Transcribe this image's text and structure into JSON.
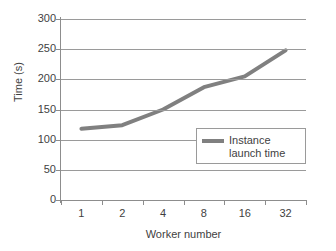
{
  "chart_data": {
    "type": "line",
    "title": "",
    "xlabel": "Worker number",
    "ylabel": "Time (s)",
    "categories": [
      "1",
      "2",
      "4",
      "8",
      "16",
      "32"
    ],
    "x_tick_labels": [
      "1",
      "2",
      "4",
      "8",
      "16",
      "32"
    ],
    "y_tick_labels": [
      "0",
      "50",
      "100",
      "150",
      "200",
      "250",
      "300"
    ],
    "y_ticks": [
      0,
      50,
      100,
      150,
      200,
      250,
      300
    ],
    "ylim": [
      0,
      300
    ],
    "grid": "horizontal",
    "legend_position": "inside-lower-right",
    "series": [
      {
        "name": "Instance launch time",
        "color": "#808080",
        "values": [
          118,
          124,
          150,
          187,
          205,
          248
        ]
      }
    ]
  },
  "legend": {
    "entries": [
      {
        "label_line1": "Instance",
        "label_line2": "launch time",
        "color": "#808080"
      }
    ]
  },
  "axes": {
    "y_title": "Time (s)",
    "x_title": "Worker number"
  }
}
